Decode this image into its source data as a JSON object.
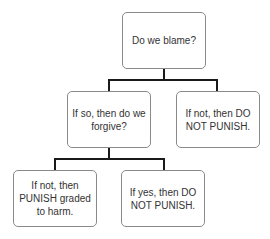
{
  "diagram": {
    "type": "decision-tree",
    "nodes": {
      "root": {
        "label": "Do we blame?"
      },
      "forgive": {
        "label": "If so, then  do we forgive?"
      },
      "no_blame": {
        "label": "If not, then DO NOT  PUNISH."
      },
      "no_forgive": {
        "label": "If not, then PUNISH  graded to harm."
      },
      "yes_forgive": {
        "label": "If yes, then DO NOT PUNISH."
      }
    },
    "edges": [
      {
        "from": "root",
        "to": "forgive"
      },
      {
        "from": "root",
        "to": "no_blame"
      },
      {
        "from": "forgive",
        "to": "no_forgive"
      },
      {
        "from": "forgive",
        "to": "yes_forgive"
      }
    ]
  }
}
